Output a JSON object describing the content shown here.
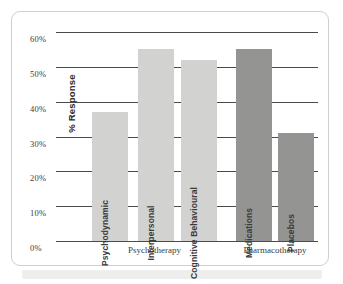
{
  "chart_data": {
    "type": "bar",
    "title": "",
    "xlabel": "",
    "ylabel": "% Response",
    "ylim": [
      0,
      60
    ],
    "grid": true,
    "legend": "none",
    "categories": [
      "Psychodynamic",
      "Interpersonal",
      "Cognitive Behavioural",
      "Medications",
      "Placebos"
    ],
    "values": [
      37,
      55,
      52,
      55,
      31
    ],
    "ytick_labels": [
      "60%",
      "50%",
      "40%",
      "30%",
      "20%",
      "10%",
      "0%"
    ],
    "ytick_values": [
      60,
      50,
      40,
      30,
      20,
      10,
      0
    ],
    "groups": [
      {
        "label": "Psychotherapy",
        "categories": [
          "Psychodynamic",
          "Interpersonal",
          "Cognitive Behavioural"
        ],
        "color": "#d2d2d0"
      },
      {
        "label": "Pharmacotherapy",
        "categories": [
          "Medications",
          "Placebos"
        ],
        "color": "#949492"
      }
    ],
    "bars": [
      {
        "label": "Psychodynamic",
        "value": 37,
        "group": "Psychotherapy",
        "color": "#d2d2d0"
      },
      {
        "label": "Interpersonal",
        "value": 55,
        "group": "Psychotherapy",
        "color": "#d2d2d0"
      },
      {
        "label": "Cognitive Behavioural",
        "value": 52,
        "group": "Psychotherapy",
        "color": "#d2d2d0"
      },
      {
        "label": "Medications",
        "value": 55,
        "group": "Pharmacotherapy",
        "color": "#949492"
      },
      {
        "label": "Placebos",
        "value": 31,
        "group": "Pharmacotherapy",
        "color": "#949492"
      }
    ]
  },
  "colors": {
    "bar_light": "#d2d2d0",
    "bar_dark": "#949492",
    "gridline": "#4a4a4a",
    "frame": "#cfcfcf",
    "text": "#3c3c3c"
  }
}
